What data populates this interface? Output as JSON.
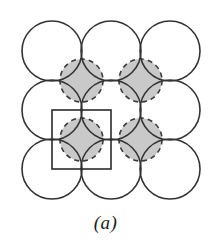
{
  "figure": {
    "caption": "(a)",
    "type": "crystal-packing-diagram",
    "colors": {
      "background": "#ffffff",
      "stroke": "#333333",
      "shading": "#c9c9c9",
      "dashed_stroke": "#3a3a3a",
      "unit_cell_stroke": "#2b2b2b",
      "caption_color": "#1a1a1a"
    },
    "geometry": {
      "canvas_width": 211,
      "canvas_height": 248,
      "lattice_spacing": 59,
      "sphere_radius": 30,
      "interstitial_radius": 21.5,
      "grid_origin_x": 52,
      "grid_origin_y": 51,
      "rows": 3,
      "columns": 3,
      "stroke_width": 1.6,
      "dash_pattern": "5,4"
    },
    "spheres": [
      {
        "id": "sphere-r0-c0",
        "cx": 52,
        "cy": 51
      },
      {
        "id": "sphere-r0-c1",
        "cx": 111,
        "cy": 51
      },
      {
        "id": "sphere-r0-c2",
        "cx": 170,
        "cy": 51
      },
      {
        "id": "sphere-r1-c0",
        "cx": 52,
        "cy": 110
      },
      {
        "id": "sphere-r1-c1",
        "cx": 111,
        "cy": 110
      },
      {
        "id": "sphere-r1-c2",
        "cx": 170,
        "cy": 110
      },
      {
        "id": "sphere-r2-c0",
        "cx": 52,
        "cy": 169
      },
      {
        "id": "sphere-r2-c1",
        "cx": 111,
        "cy": 169
      },
      {
        "id": "sphere-r2-c2",
        "cx": 170,
        "cy": 169
      }
    ],
    "interstitials": [
      {
        "id": "interstitial-0-0",
        "cx": 81.5,
        "cy": 80.5
      },
      {
        "id": "interstitial-0-1",
        "cx": 140.5,
        "cy": 80.5
      },
      {
        "id": "interstitial-1-0",
        "cx": 81.5,
        "cy": 139.5
      },
      {
        "id": "interstitial-1-1",
        "cx": 140.5,
        "cy": 139.5
      }
    ],
    "unit_cell": {
      "id": "unit-cell-square",
      "x": 52,
      "y": 110,
      "width": 59,
      "height": 59,
      "label": "unit cell"
    },
    "shaded_region": {
      "id": "interstitial-shading",
      "x": 52,
      "y": 51,
      "width": 118,
      "height": 118,
      "description": "shaded interstitial area between the central four spheres"
    }
  }
}
